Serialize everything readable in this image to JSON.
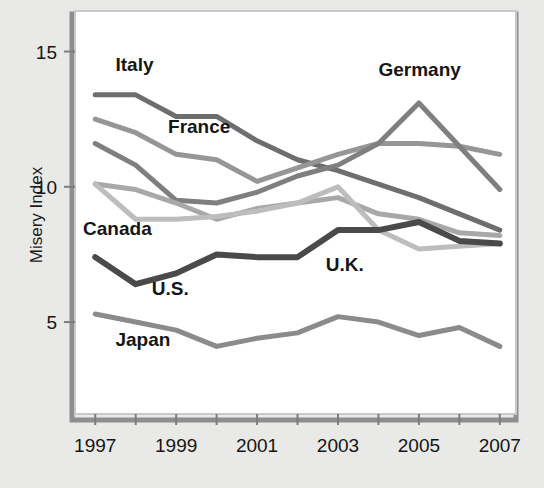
{
  "chart_data": {
    "type": "line",
    "title": "",
    "xlabel": "",
    "ylabel": "Misery Index",
    "x": [
      1997,
      1998,
      1999,
      2000,
      2001,
      2002,
      2003,
      2004,
      2005,
      2006,
      2007
    ],
    "xlim": [
      1996.5,
      2007.4
    ],
    "ylim": [
      1.6,
      16.5
    ],
    "xticks": [
      1997,
      1998,
      1999,
      2000,
      2001,
      2002,
      2003,
      2004,
      2005,
      2006,
      2007
    ],
    "xticklabels": [
      "1997",
      "",
      "1999",
      "",
      "2001",
      "",
      "2003",
      "",
      "2005",
      "",
      "2007"
    ],
    "yticks": [
      5,
      10,
      15
    ],
    "yticklabels": [
      "5",
      "10",
      "15"
    ],
    "grid": false,
    "legend_position": "inline-labels",
    "series": [
      {
        "name": "Italy",
        "color": "#6e6e6e",
        "width": 5,
        "values": [
          13.4,
          13.4,
          12.6,
          12.6,
          11.7,
          11.0,
          10.6,
          10.1,
          9.6,
          9.0,
          8.4
        ]
      },
      {
        "name": "France",
        "color": "#969696",
        "width": 5,
        "values": [
          12.5,
          12.0,
          11.2,
          11.0,
          10.2,
          10.7,
          11.2,
          11.6,
          11.6,
          11.5,
          11.2
        ]
      },
      {
        "name": "Germany",
        "color": "#7f7f7f",
        "width": 5,
        "values": [
          11.6,
          10.8,
          9.5,
          9.4,
          9.8,
          10.4,
          10.8,
          11.6,
          13.1,
          11.5,
          9.9
        ]
      },
      {
        "name": "Canada",
        "color": "#a8a8a8",
        "width": 5,
        "values": [
          10.1,
          9.9,
          9.4,
          8.8,
          9.2,
          9.4,
          9.6,
          9.0,
          8.8,
          8.3,
          8.2
        ]
      },
      {
        "name": "U.K.",
        "color": "#bdbdbd",
        "width": 5,
        "values": [
          10.1,
          8.8,
          8.8,
          8.9,
          9.1,
          9.4,
          10.0,
          8.4,
          7.7,
          7.8,
          7.9
        ]
      },
      {
        "name": "U.S.",
        "color": "#4a4a4a",
        "width": 6,
        "values": [
          7.4,
          6.4,
          6.8,
          7.5,
          7.4,
          7.4,
          8.4,
          8.4,
          8.7,
          8.0,
          7.9
        ]
      },
      {
        "name": "Japan",
        "color": "#8b8b8b",
        "width": 5,
        "values": [
          5.3,
          5.0,
          4.7,
          4.1,
          4.4,
          4.6,
          5.2,
          5.0,
          4.5,
          4.8,
          4.1
        ]
      }
    ],
    "series_labels": [
      {
        "text": "Italy",
        "x": 1997.5,
        "y": 14.3
      },
      {
        "text": "France",
        "x": 1998.8,
        "y": 12.0
      },
      {
        "text": "Germany",
        "x": 2004.0,
        "y": 14.1
      },
      {
        "text": "Canada",
        "x": 1996.7,
        "y": 8.2
      },
      {
        "text": "U.S.",
        "x": 1998.4,
        "y": 6.0
      },
      {
        "text": "U.K.",
        "x": 2002.7,
        "y": 6.9
      },
      {
        "text": "Japan",
        "x": 1997.5,
        "y": 4.1
      }
    ],
    "colors": {
      "background": "#e9e9e7",
      "plot_background": "#ffffff",
      "frame": "#b6b6b6",
      "frame_shadow": "#8e8e8e",
      "text": "#161616"
    }
  }
}
